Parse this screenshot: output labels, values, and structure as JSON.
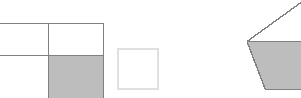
{
  "canvas": {
    "width": 301,
    "height": 98,
    "background": "#ffffff",
    "description": "Three geometric fraction-model figures on a plain white background"
  },
  "palette": {
    "shaded_fill": "#bdbdbd",
    "unshaded_fill": "#ffffff",
    "stroke_dark": "#808080",
    "stroke_light": "#e0e0e0",
    "background": "#ffffff"
  },
  "figures": [
    {
      "id": "grid-rectangle",
      "label": "Rectangle divided into four cells",
      "type": "rectangle-grid",
      "cropped": "left edge clipped by image boundary",
      "bounds": {
        "x": 0,
        "y": 23,
        "width": 104,
        "height": 75
      },
      "rows": 2,
      "columns": 2,
      "divider_x": 49,
      "divider_y": 56,
      "shaded_cells": [
        "bottom-right"
      ],
      "shaded_count": 1,
      "total_cells": 4,
      "fraction": "1/4",
      "stroke": "#808080",
      "fill_shaded": "#bdbdbd",
      "fill_unshaded": "#ffffff"
    },
    {
      "id": "small-square",
      "label": "Small empty square",
      "type": "square",
      "bounds": {
        "x": 117,
        "y": 48,
        "width": 41,
        "height": 41
      },
      "shaded_count": 0,
      "total_cells": 1,
      "fraction": "0/1",
      "stroke": "#e0e0e0",
      "fill_unshaded": "#ffffff"
    },
    {
      "id": "hexagon-half-shaded",
      "label": "Hexagon with lower half shaded",
      "type": "hexagon",
      "cropped": "right edge clipped by image boundary",
      "bounds": {
        "x": 247,
        "y": 0,
        "width": 54,
        "height": 91
      },
      "left_vertex": {
        "x": 247,
        "y": 42
      },
      "bottom_left_vertex": {
        "x": 265,
        "y": 90
      },
      "midline_y": 44,
      "shaded_count": 1,
      "total_cells": 2,
      "fraction": "1/2",
      "stroke": "#808080",
      "fill_shaded": "#bdbdbd",
      "fill_unshaded": "#ffffff"
    }
  ]
}
